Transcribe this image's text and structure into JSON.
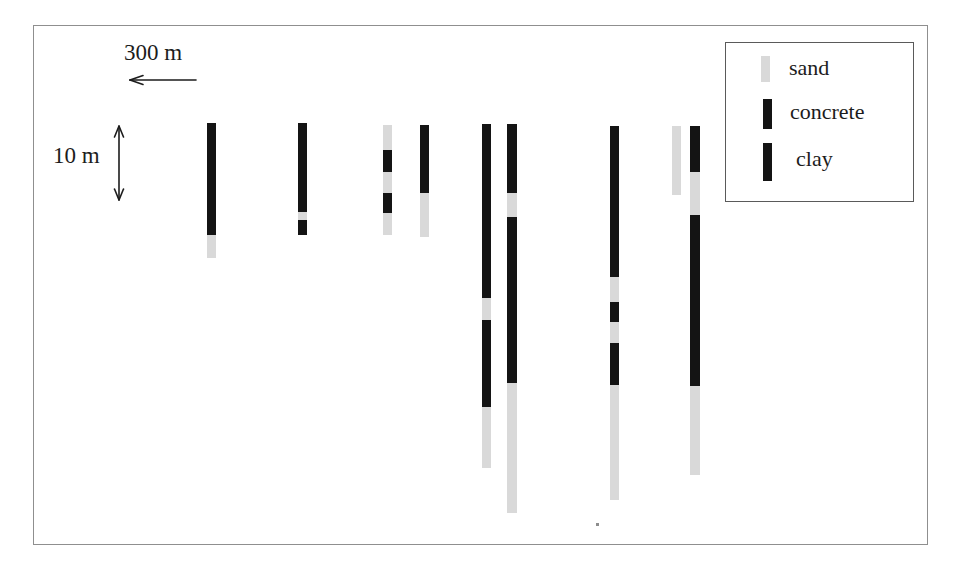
{
  "colors": {
    "sand": "#d9d9d9",
    "dark": "#141414",
    "text": "#1c1c1c",
    "arrow": "#1c1c1c",
    "frame_border": "#8f8f8f",
    "legend_border": "#5a5a5a"
  },
  "scales": {
    "horizontal": {
      "label": "300 m"
    },
    "vertical": {
      "label": "10 m"
    }
  },
  "legend": {
    "items": [
      {
        "label": "sand",
        "material": "sand"
      },
      {
        "label": "concrete",
        "material": "dark"
      },
      {
        "label": "clay",
        "material": "dark"
      }
    ]
  },
  "boreholes": [
    {
      "id": 1,
      "x": 207,
      "top": 123,
      "width": 9,
      "segments": [
        {
          "material": "dark",
          "h": 112
        },
        {
          "material": "sand",
          "h": 23
        }
      ]
    },
    {
      "id": 2,
      "x": 298,
      "top": 123,
      "width": 9,
      "segments": [
        {
          "material": "dark",
          "h": 89
        },
        {
          "material": "sand",
          "h": 8
        },
        {
          "material": "dark",
          "h": 15
        }
      ]
    },
    {
      "id": 3,
      "x": 383,
      "top": 125,
      "width": 9,
      "segments": [
        {
          "material": "sand",
          "h": 25
        },
        {
          "material": "dark",
          "h": 22
        },
        {
          "material": "sand",
          "h": 21
        },
        {
          "material": "dark",
          "h": 20
        },
        {
          "material": "sand",
          "h": 22
        }
      ]
    },
    {
      "id": 4,
      "x": 420,
      "top": 125,
      "width": 9,
      "segments": [
        {
          "material": "dark",
          "h": 68
        },
        {
          "material": "sand",
          "h": 44
        }
      ]
    },
    {
      "id": 5,
      "x": 482,
      "top": 124,
      "width": 9,
      "segments": [
        {
          "material": "dark",
          "h": 174
        },
        {
          "material": "sand",
          "h": 22
        },
        {
          "material": "dark",
          "h": 87
        },
        {
          "material": "sand",
          "h": 61
        }
      ]
    },
    {
      "id": 6,
      "x": 507,
      "top": 124,
      "width": 10,
      "segments": [
        {
          "material": "dark",
          "h": 69
        },
        {
          "material": "sand",
          "h": 24
        },
        {
          "material": "dark",
          "h": 166
        },
        {
          "material": "sand",
          "h": 130
        }
      ]
    },
    {
      "id": 7,
      "x": 610,
      "top": 126,
      "width": 9,
      "segments": [
        {
          "material": "dark",
          "h": 151
        },
        {
          "material": "sand",
          "h": 25
        },
        {
          "material": "dark",
          "h": 20
        },
        {
          "material": "sand",
          "h": 21
        },
        {
          "material": "dark",
          "h": 42
        },
        {
          "material": "sand",
          "h": 115
        }
      ]
    },
    {
      "id": 8,
      "x": 672,
      "top": 126,
      "width": 9,
      "segments": [
        {
          "material": "sand",
          "h": 69
        }
      ]
    },
    {
      "id": 9,
      "x": 690,
      "top": 126,
      "width": 10,
      "segments": [
        {
          "material": "dark",
          "h": 46
        },
        {
          "material": "sand",
          "h": 43
        },
        {
          "material": "dark",
          "h": 171
        },
        {
          "material": "sand",
          "h": 89
        }
      ]
    }
  ]
}
